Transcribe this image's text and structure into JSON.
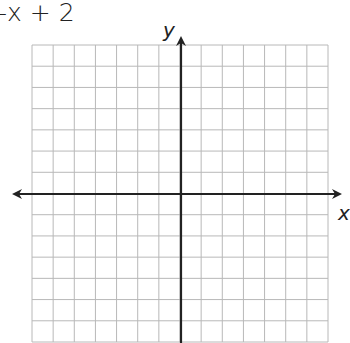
{
  "equation": "-x + 2",
  "graph": {
    "x_axis_label": "x",
    "y_axis_label": "y",
    "grid": {
      "columns": 14,
      "rows": 14,
      "left": 32,
      "top": 45,
      "right": 328,
      "bottom": 342,
      "line_color": "#b8b8b8"
    },
    "axes": {
      "origin_x": 181,
      "origin_y": 194,
      "color": "#222222",
      "x_axis_extent": [
        12,
        342
      ],
      "y_axis_extent": [
        36,
        343
      ]
    }
  }
}
